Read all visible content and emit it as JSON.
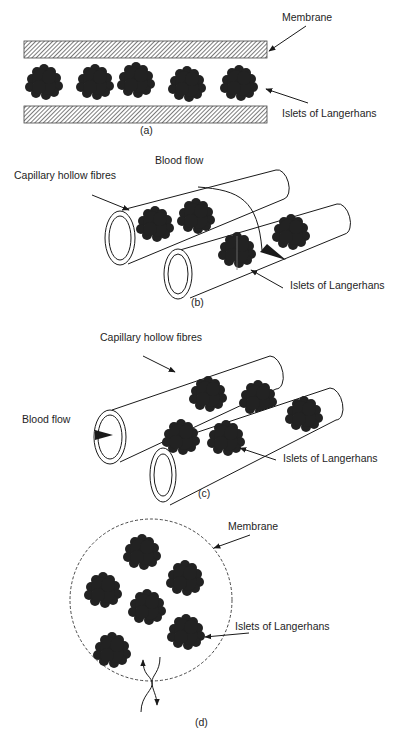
{
  "figure": {
    "panels": [
      {
        "id": "a",
        "caption": "(a)",
        "description": "Flat sheet membrane device: islets sandwiched between two membrane layers",
        "labels": {
          "membrane": "Membrane",
          "islets": "Islets of Langerhans"
        }
      },
      {
        "id": "b",
        "caption": "(b)",
        "description": "Islets outside capillary hollow fibres, blood flows inside fibres",
        "labels": {
          "fibres": "Capillary hollow fibres",
          "blood_flow": "Blood flow",
          "islets": "Islets of Langerhans"
        }
      },
      {
        "id": "c",
        "caption": "(c)",
        "description": "Islets within capillary hollow fibres, blood flow through lumen",
        "labels": {
          "fibres": "Capillary hollow fibres",
          "blood_flow": "Blood flow",
          "islets": "Islets of Langerhans"
        }
      },
      {
        "id": "d",
        "caption": "(d)",
        "description": "Microcapsule: islets enclosed in spherical membrane, exchange across membrane",
        "labels": {
          "membrane": "Membrane",
          "islets": "Islets of Langerhans"
        }
      }
    ],
    "colors": {
      "ink": "#1a1a1a",
      "islet": "#222222",
      "background": "#ffffff"
    }
  }
}
